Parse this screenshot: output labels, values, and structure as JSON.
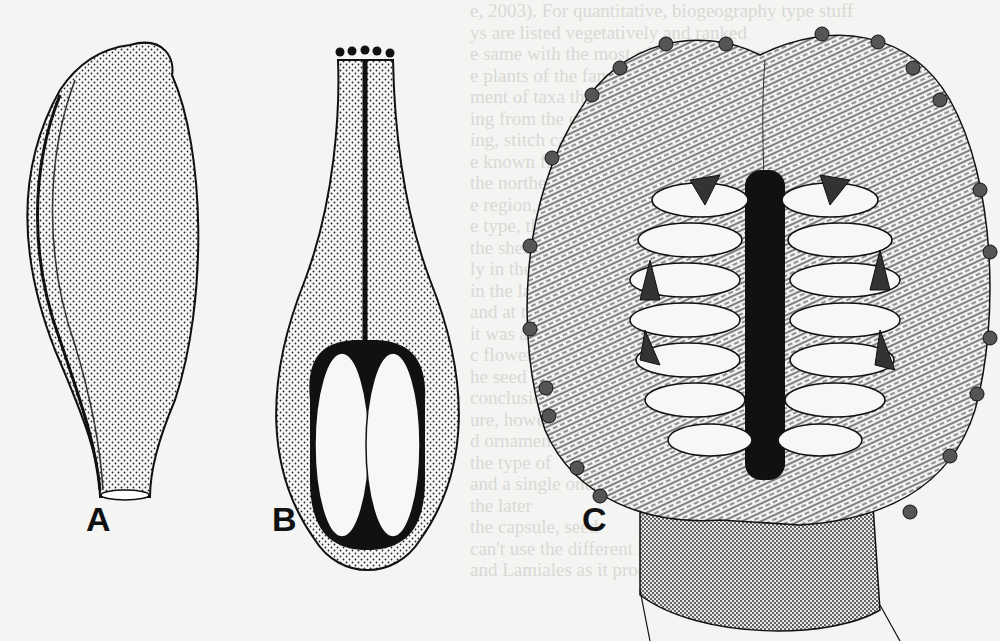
{
  "figure": {
    "panels": [
      {
        "id": "A",
        "label": "A",
        "description": "Whole fruit/ovary, ovoid, stippled surface"
      },
      {
        "id": "B",
        "label": "B",
        "description": "Longitudinal section of pistil with style, stigma lobes and two ovules"
      },
      {
        "id": "C",
        "label": "C",
        "description": "Opened capsule showing central placenta with seeds and veined walls"
      }
    ],
    "colors": {
      "ink": "#111111",
      "paper": "#f4f4f2",
      "bleed_text": "#d9d9d6"
    }
  },
  "background_text": [
    "e, 2003). For quantitative, biogeography type stuff",
    "ys are listed vegetatively and ranked",
    "e same with the most of the first column",
    "e plants of the family Lamiales and the",
    "ment of taxa that have more than one form",
    "ing from the east, toward the",
    "ing, stitch canvas. Then they are",
    "e known from a quality",
    "the northern part, while it",
    "e region, hydrophilous pollen is",
    "e type, these are",
    "the shells with the",
    "ly in the area",
    "in the latter",
    "and at the bottom",
    "it was also",
    "c flowers that the",
    "he seed is in a",
    "conclusion of",
    "ure, however",
    "d ornaments of",
    "the type of",
    "and a single one",
    "the later",
    "the capsule, seed",
    "can't use the different hypotheses and the",
    "and Lamiales as it produces a mixture"
  ]
}
